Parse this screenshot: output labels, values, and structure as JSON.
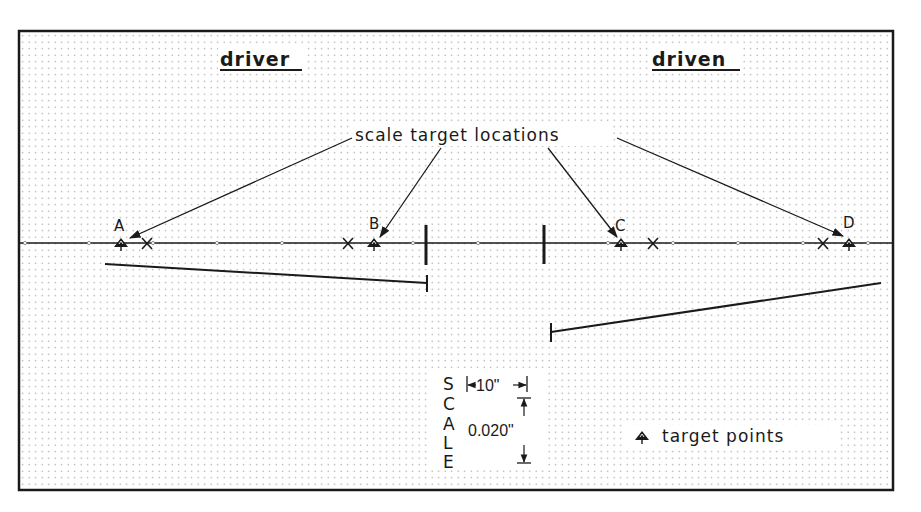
{
  "diagram": {
    "titles": {
      "left": "driver",
      "right": "driven"
    },
    "callout_label": "scale target locations",
    "points": [
      {
        "id": "A",
        "label": "A"
      },
      {
        "id": "B",
        "label": "B"
      },
      {
        "id": "C",
        "label": "C"
      },
      {
        "id": "D",
        "label": "D"
      }
    ],
    "scale": {
      "vertical_label": [
        "S",
        "C",
        "A",
        "L",
        "E"
      ],
      "horizontal_value": "10\"",
      "vertical_value": "0.020\""
    },
    "legend": {
      "symbol": "target-point-icon",
      "label": "target points"
    },
    "colors": {
      "ink": "#1a1a1a",
      "grid_dot": "#9a9a9a",
      "background": "#ffffff"
    }
  }
}
